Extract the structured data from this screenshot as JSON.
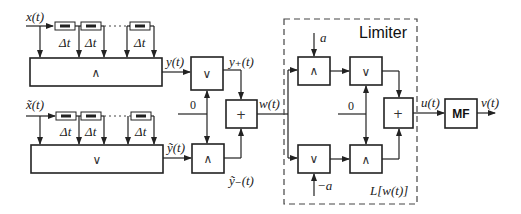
{
  "diagram": {
    "inputs": {
      "x": "x(t)",
      "x_tilde": "x̃(t)"
    },
    "delay_label": "Δt",
    "blocks": {
      "upper_bank_op": "∧",
      "lower_bank_op": "∨",
      "or_upper_op": "∨",
      "and_lower_op": "∧",
      "sum_op": "+",
      "limiter_and_top_op": "∧",
      "limiter_or_top_op": "∨",
      "limiter_or_bottom_op": "∨",
      "limiter_and_bottom_op": "∧",
      "limiter_sum_op": "+",
      "mf_label": "MF"
    },
    "signals": {
      "y": "y(t)",
      "y_tilde": "ỹ(t)",
      "y_plus": "y₊(t)",
      "y_minus_tilde": "ỹ₋(t)",
      "w": "w(t)",
      "u": "u(t)",
      "v": "v(t)",
      "zero_left": "0",
      "zero_right": "0",
      "a": "a",
      "minus_a": "−a"
    },
    "limiter": {
      "title": "Limiter",
      "function_label": "L[w(t)]"
    }
  }
}
